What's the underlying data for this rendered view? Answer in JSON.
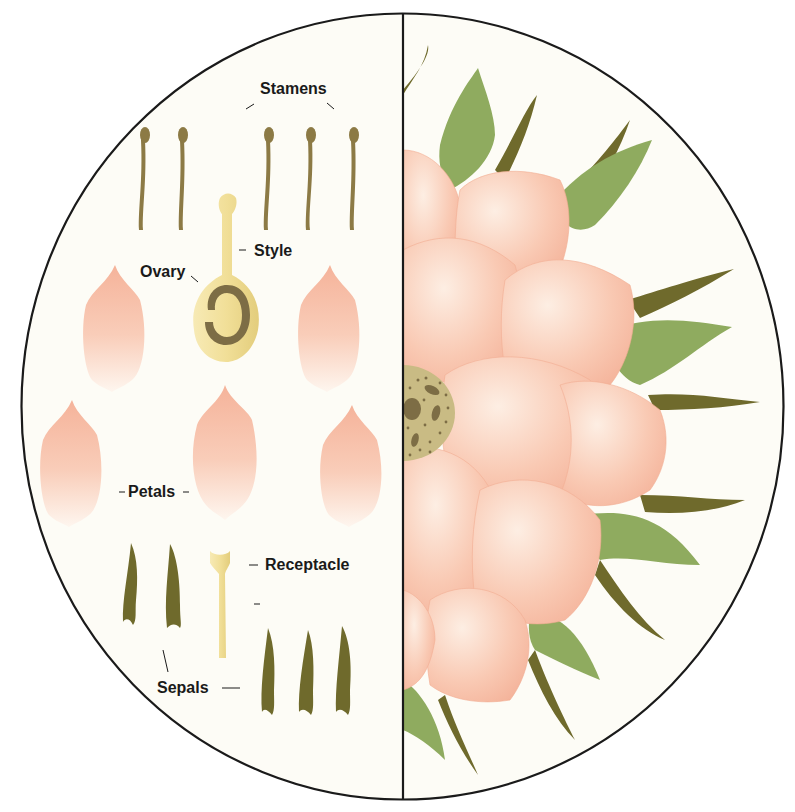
{
  "diagram": {
    "left_panel": {
      "description": "Separated flower parts",
      "labels": {
        "stamens": "Stamens",
        "style": "Style",
        "ovary": "Ovary",
        "petals": "Petals",
        "receptacle": "Receptacle",
        "sepals": "Sepals"
      },
      "counts": {
        "stamens": 5,
        "petals": 6,
        "sepals": 5,
        "pistil": 1,
        "receptacle": 1
      }
    },
    "right_panel": {
      "description": "Assembled flower (half view) showing petals, sepals, and central receptacle"
    },
    "colors": {
      "background": "#fdfcf6",
      "outline": "#1a1a1a",
      "petal": "#f6b9a0",
      "petal_light": "#fdeee2",
      "sepal_dark": "#6f6a2c",
      "sepal_leaf": "#8fab5f",
      "stamen": "#8c7a45",
      "pistil": "#f2e2a0",
      "ovary_ring": "#7d6d45",
      "center": "#c9bb84"
    }
  }
}
